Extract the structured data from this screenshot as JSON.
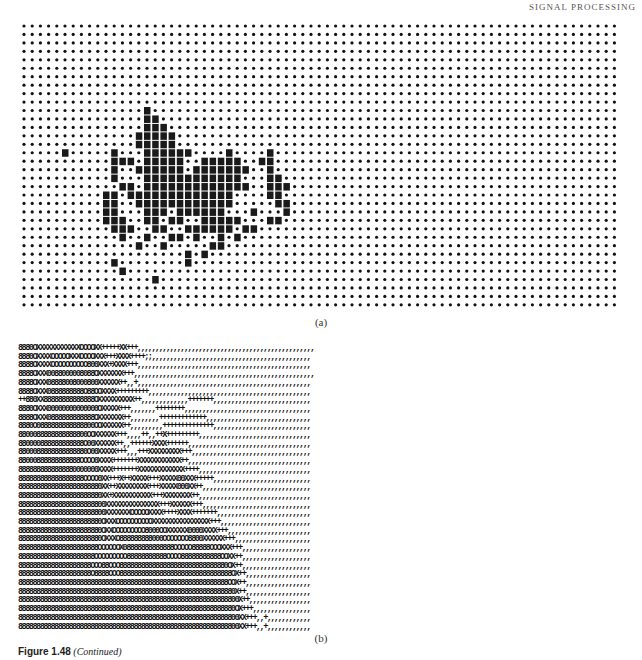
{
  "page": {
    "running_head": "SIGNAL PROCESSING"
  },
  "figure_a": {
    "label": "(a)",
    "cols": 73,
    "rows": 34,
    "cell_w": 8.2,
    "cell_h": 8.45,
    "dot_color": "#111111",
    "block_color": "#1a1a1a",
    "blocks": [
      [
        10,
        15
      ],
      [
        11,
        15
      ],
      [
        11,
        16
      ],
      [
        12,
        15
      ],
      [
        12,
        16
      ],
      [
        12,
        17
      ],
      [
        13,
        14
      ],
      [
        13,
        15
      ],
      [
        13,
        16
      ],
      [
        13,
        17
      ],
      [
        13,
        18
      ],
      [
        14,
        14
      ],
      [
        14,
        15
      ],
      [
        14,
        16
      ],
      [
        14,
        17
      ],
      [
        14,
        18
      ],
      [
        15,
        5
      ],
      [
        15,
        11
      ],
      [
        15,
        15
      ],
      [
        15,
        16
      ],
      [
        15,
        17
      ],
      [
        15,
        18
      ],
      [
        15,
        19
      ],
      [
        15,
        20
      ],
      [
        15,
        25
      ],
      [
        15,
        30
      ],
      [
        16,
        11
      ],
      [
        16,
        12
      ],
      [
        16,
        13
      ],
      [
        16,
        15
      ],
      [
        16,
        16
      ],
      [
        16,
        17
      ],
      [
        16,
        18
      ],
      [
        16,
        19
      ],
      [
        16,
        22
      ],
      [
        16,
        23
      ],
      [
        16,
        24
      ],
      [
        16,
        25
      ],
      [
        16,
        26
      ],
      [
        16,
        29
      ],
      [
        16,
        30
      ],
      [
        17,
        11
      ],
      [
        17,
        14
      ],
      [
        17,
        15
      ],
      [
        17,
        16
      ],
      [
        17,
        17
      ],
      [
        17,
        18
      ],
      [
        17,
        19
      ],
      [
        17,
        21
      ],
      [
        17,
        22
      ],
      [
        17,
        23
      ],
      [
        17,
        24
      ],
      [
        17,
        25
      ],
      [
        17,
        26
      ],
      [
        17,
        27
      ],
      [
        17,
        30
      ],
      [
        18,
        11
      ],
      [
        18,
        15
      ],
      [
        18,
        16
      ],
      [
        18,
        17
      ],
      [
        18,
        18
      ],
      [
        18,
        19
      ],
      [
        18,
        20
      ],
      [
        18,
        21
      ],
      [
        18,
        22
      ],
      [
        18,
        23
      ],
      [
        18,
        24
      ],
      [
        18,
        25
      ],
      [
        18,
        26
      ],
      [
        18,
        30
      ],
      [
        18,
        31
      ],
      [
        19,
        12
      ],
      [
        19,
        13
      ],
      [
        19,
        15
      ],
      [
        19,
        16
      ],
      [
        19,
        17
      ],
      [
        19,
        18
      ],
      [
        19,
        19
      ],
      [
        19,
        20
      ],
      [
        19,
        21
      ],
      [
        19,
        22
      ],
      [
        19,
        23
      ],
      [
        19,
        24
      ],
      [
        19,
        25
      ],
      [
        19,
        26
      ],
      [
        19,
        27
      ],
      [
        19,
        30
      ],
      [
        19,
        31
      ],
      [
        19,
        32
      ],
      [
        20,
        10
      ],
      [
        20,
        11
      ],
      [
        20,
        13
      ],
      [
        20,
        14
      ],
      [
        20,
        15
      ],
      [
        20,
        16
      ],
      [
        20,
        17
      ],
      [
        20,
        18
      ],
      [
        20,
        19
      ],
      [
        20,
        20
      ],
      [
        20,
        21
      ],
      [
        20,
        22
      ],
      [
        20,
        23
      ],
      [
        20,
        24
      ],
      [
        20,
        25
      ],
      [
        20,
        30
      ],
      [
        20,
        31
      ],
      [
        21,
        10
      ],
      [
        21,
        11
      ],
      [
        21,
        14
      ],
      [
        21,
        15
      ],
      [
        21,
        16
      ],
      [
        21,
        17
      ],
      [
        21,
        18
      ],
      [
        21,
        19
      ],
      [
        21,
        20
      ],
      [
        21,
        21
      ],
      [
        21,
        22
      ],
      [
        21,
        23
      ],
      [
        21,
        24
      ],
      [
        21,
        25
      ],
      [
        21,
        31
      ],
      [
        21,
        32
      ],
      [
        22,
        10
      ],
      [
        22,
        11
      ],
      [
        22,
        15
      ],
      [
        22,
        16
      ],
      [
        22,
        17
      ],
      [
        22,
        19
      ],
      [
        22,
        20
      ],
      [
        22,
        21
      ],
      [
        22,
        22
      ],
      [
        22,
        23
      ],
      [
        22,
        24
      ],
      [
        22,
        28
      ],
      [
        22,
        32
      ],
      [
        23,
        10
      ],
      [
        23,
        11
      ],
      [
        23,
        12
      ],
      [
        23,
        15
      ],
      [
        23,
        16
      ],
      [
        23,
        18
      ],
      [
        23,
        19
      ],
      [
        23,
        22
      ],
      [
        23,
        23
      ],
      [
        23,
        24
      ],
      [
        23,
        25
      ],
      [
        23,
        26
      ],
      [
        23,
        30
      ],
      [
        23,
        31
      ],
      [
        24,
        11
      ],
      [
        24,
        12
      ],
      [
        24,
        13
      ],
      [
        24,
        16
      ],
      [
        24,
        17
      ],
      [
        24,
        20
      ],
      [
        24,
        21
      ],
      [
        24,
        22
      ],
      [
        24,
        23
      ],
      [
        24,
        24
      ],
      [
        24,
        25
      ],
      [
        24,
        27
      ],
      [
        24,
        28
      ],
      [
        25,
        12
      ],
      [
        25,
        15
      ],
      [
        25,
        18
      ],
      [
        25,
        19
      ],
      [
        25,
        21
      ],
      [
        25,
        24
      ],
      [
        25,
        26
      ],
      [
        26,
        14
      ],
      [
        26,
        17
      ],
      [
        26,
        23
      ],
      [
        26,
        24
      ],
      [
        27,
        20
      ],
      [
        27,
        22
      ],
      [
        28,
        11
      ],
      [
        28,
        20
      ],
      [
        29,
        12
      ],
      [
        30,
        16
      ]
    ]
  },
  "figure_b": {
    "label": "(b)",
    "rows": [
      "8880OXXXXXXXXXXXXOOOOXX+++++XX+++,,,,,,,,,,,,,,,,,,,,,,,,,,,,,,,,,,,,,,,,,,,,,,,,,",
      "8880OXXXXOOOOOXXXOOOOXXX+++XXXX++++;;,,,,,,,,,,,,,,,,,,,,,,,,,,,,,,,,,,,,,,,,,,,,",
      "8888OXXXXOOOOOOOOOO800XXX+XXXX+++,,,,,,,,,,,,,,,,,,,,,,,,,,,,,,,,,,,,,,,,,,,,,,,,",
      "8888OXXX0088000008088OXXXXXXX+++,,,,,,,,,,,,,,,,,,,,,,,,,,,,,,,,,,,,,,,,,,,,,,,,,,",
      "8888OXXX08888008000800XXXXXX++,,+,,,,,,,,,,,,,,,,,,,,,,,,,,,,,,,,,,,,,,,,,,,,,,,,",
      "8888OXXX0888888888O88OOXXXX+++++++++,,,,,,,,,,,,,,,,,,,,,,,,,,,,,,,,,,,,,,,,,,,,,",
      "++880XX88888888888888OXXXXXXXXXX++,,,,,,,,,,,,,+++++++,,,,,,,,,,,,,,,,,,,,,,,,,,,",
      "8880OXXX00000000000000OXXXXX+++,,,,,,,++++++++,,,,,,,,,,,,,,,,,,,,,,,,,,,,,,,,,,,",
      "8888OXXX0888888888888OXXXXXXX++,,,,,,,,+++++++++++++,,,,,,,,,,,,,,,,,,,,,,,,,,,,,",
      "8880O0888888888888800OOXXXXXX++,,,,,,,,,++++++++++++++,,,,,,,,,,,,,,,,,,,,,,,,,,,",
      "8800088888888888800OOXXXXXX+++,,,,++,,++X+++++++++,,,,,,,,,,,,,,,,,,,,,,,,,,,,,,,",
      "880000888888888888O00XXXXXX++,,++++++XXXX++++++,,,,,,,,,,,,,,,,,,,,,,,,,,,,,,,,,,",
      "8800088888888888880O00XXXXX+++,,,+++XXXXXXXXX+++,,,,,,,,,,,,,,,,,,,,,,,,,,,,,,,,,",
      "88000888888888888OOOO0XXXX+++++++XXXXXXXXXXXX++,,,,,,,,,,,,,,,,,,,,,,,,,,,,,,,,,,",
      "8888888888888880000000XXXX+++++++XXXXXXXXXXXXX++++,,,,,,,,,,,,,,,,,,,,,,,,,,,,,,,",
      "888888888888888888OOOO0XX+++X++XXXXX+++XXXXX00XXX+++++,,,,,,,,,,,,,,,,,,,,,,,,,,,",
      "88888888888888888888880XX++XXXXXXXXX+++XXXXX000XX++,,,,,,,,,,,,,,,,,,,,,,,,,,,,,,",
      "88888888888888888888880XX+XXXXXXXXXXX+++XXXXXXXX++,,,,,,,,,,,,,,,,,,,,,,,,,,,,,,,",
      "888888888888888888888800XXXXXXXXXXXXXXX+++XXXXXX+++,,,,,,,,,,,,,,,,,,,,,,,,,,,,,,",
      "888888888888888888888800XXXXXXXOOOOOXXXX++++XXXX+++++++,,,,,,,,,,,,,,,,,,,,,,,,,,",
      "88888888888888888888880OXXXOOOOOOOOOOXXXXXXXXXXXXXXXX+++,,,,,,,,,,,,,,,,,,,,,,,,,",
      "88888888888888888888880OXXOOOOOOOOO8000OOXXXXXX0000XXXX+++,,,,,,,,,,,,,,,,,,,,,,,",
      "88888888888888888888880OXXXO888888888000OOOOOOO8800XXXXXX+++,,,,,,,,,,,,,,,,,,,,,",
      "8888888888888888888888OOOOOOX08888888888888OOOOO88888OOOXXX+++,,,,,,,,,,,,,,,,,,,",
      "888888888888888888888OOOOOOOOO88888888888OOOO88888888888OOXX++,,,,,,,,,,,,,,,,,,,",
      "88888888888888888888OOO88OOO888888888888888888888888888880OX++,,,,,,,,,,,,,,,,,,,",
      "88888888888888888888O8888OOO8888888888888888888888888888888OX++,,,,,,,,,,,,,,,,,,",
      "8888888888888888888888888888888888888888888888888888888888OOX++,,,,,,,,,,,,,,,,,,",
      "888888888888888888888888888888888888888888888888888888888880X++,,,,,,,,,,,,,,,,,,",
      "8888888888888888888888888888888888888888888888888888888888800X++,,,,,,,,,,,,,,,,,",
      "888888888888888888888888888888888888888888888888888888888880OX+++,,,,,,,,,,,,,,,,",
      "8888888888888888888888888888888888888888888888888888888888800XX+++,,+,,,,,,,,,,,,",
      "8888888888888888888888888888888888888888888888888888888888800XX+++,,+,,,,,,,,,,,,"
    ]
  },
  "caption": {
    "figure_number": "Figure 1.48",
    "note": "(Continued)"
  }
}
